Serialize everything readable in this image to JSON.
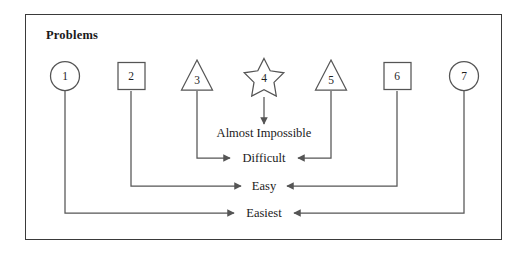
{
  "figure": {
    "title": "Problems",
    "border_color": "#3a3a3a",
    "line_color": "#555555",
    "background": "#ffffff"
  },
  "nodes": [
    {
      "id": "node-1",
      "label": "1",
      "shape": "circle",
      "cx": 65,
      "cy": 76
    },
    {
      "id": "node-2",
      "label": "2",
      "shape": "square",
      "cx": 131,
      "cy": 76
    },
    {
      "id": "node-3",
      "label": "3",
      "shape": "triangle",
      "cx": 197,
      "cy": 76
    },
    {
      "id": "node-4",
      "label": "4",
      "shape": "star",
      "cx": 264,
      "cy": 76
    },
    {
      "id": "node-5",
      "label": "5",
      "shape": "triangle",
      "cx": 331,
      "cy": 76
    },
    {
      "id": "node-6",
      "label": "6",
      "shape": "square",
      "cx": 397,
      "cy": 76
    },
    {
      "id": "node-7",
      "label": "7",
      "shape": "circle",
      "cx": 464,
      "cy": 76
    }
  ],
  "levels": [
    {
      "id": "level-almost-impossible",
      "label": "Almost Impossible",
      "x": 264,
      "y": 133
    },
    {
      "id": "level-difficult",
      "label": "Difficult",
      "x": 264,
      "y": 158
    },
    {
      "id": "level-easy",
      "label": "Easy",
      "x": 264,
      "y": 186
    },
    {
      "id": "level-easiest",
      "label": "Easiest",
      "x": 264,
      "y": 213
    }
  ],
  "connections": [
    {
      "id": "conn-4-to-almost-impossible",
      "from": "node-4",
      "to": "level-almost-impossible",
      "direction": "down"
    },
    {
      "id": "conn-3-to-difficult",
      "from": "node-3",
      "to": "level-difficult",
      "direction": "right"
    },
    {
      "id": "conn-5-to-difficult",
      "from": "node-5",
      "to": "level-difficult",
      "direction": "left"
    },
    {
      "id": "conn-2-to-easy",
      "from": "node-2",
      "to": "level-easy",
      "direction": "right"
    },
    {
      "id": "conn-6-to-easy",
      "from": "node-6",
      "to": "level-easy",
      "direction": "left"
    },
    {
      "id": "conn-1-to-easiest",
      "from": "node-1",
      "to": "level-easiest",
      "direction": "right"
    },
    {
      "id": "conn-7-to-easiest",
      "from": "node-7",
      "to": "level-easiest",
      "direction": "left"
    }
  ]
}
